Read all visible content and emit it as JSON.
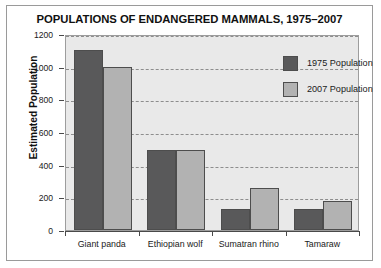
{
  "chart_data": {
    "type": "bar",
    "title": "POPULATIONS OF ENDANGERED MAMMALS, 1975–2007",
    "xlabel": "",
    "ylabel": "Estimated Population",
    "categories": [
      "Giant panda",
      "Ethiopian wolf",
      "Sumatran rhino",
      "Tamaraw"
    ],
    "series": [
      {
        "name": "1975 Population",
        "values": [
          1100,
          490,
          130,
          130
        ],
        "color": "#59595a"
      },
      {
        "name": "2007 Population",
        "values": [
          1000,
          490,
          260,
          180
        ],
        "color": "#b2b2b2"
      }
    ],
    "ylim": [
      0,
      1200
    ],
    "yticks": [
      0,
      200,
      400,
      600,
      800,
      1000,
      1200
    ],
    "ytick_labels": [
      "0",
      "200",
      "400",
      "600",
      "800",
      "1000",
      "1200"
    ],
    "grid": true,
    "grid_style": "dashed-horizontal",
    "legend_position": "top-right"
  }
}
